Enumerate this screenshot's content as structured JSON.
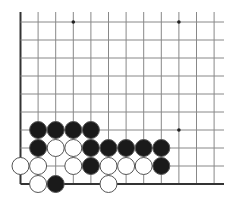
{
  "board": {
    "grid": {
      "left_x": 20.5,
      "top_y": 22,
      "col_spacing": 17.6,
      "row_spacing": 18,
      "cols": 12,
      "rows": 10,
      "right_x": 224,
      "top_extends_to": 12
    },
    "colors": {
      "line": "#888888",
      "edge": "#333333",
      "black_stone": "#1a1a1a",
      "white_stone": "#ffffff",
      "stone_outline": "#555555"
    },
    "star_points": [
      {
        "col": 3,
        "row": 0
      },
      {
        "col": 9,
        "row": 0
      },
      {
        "col": 9,
        "row": 6
      }
    ],
    "stones": [
      {
        "color": "black",
        "col": 1,
        "row": 6
      },
      {
        "color": "black",
        "col": 2,
        "row": 6
      },
      {
        "color": "black",
        "col": 3,
        "row": 6
      },
      {
        "color": "black",
        "col": 4,
        "row": 6
      },
      {
        "color": "black",
        "col": 1,
        "row": 7
      },
      {
        "color": "white",
        "col": 2,
        "row": 7
      },
      {
        "color": "white",
        "col": 3,
        "row": 7
      },
      {
        "color": "black",
        "col": 4,
        "row": 7
      },
      {
        "color": "black",
        "col": 5,
        "row": 7
      },
      {
        "color": "black",
        "col": 6,
        "row": 7
      },
      {
        "color": "black",
        "col": 7,
        "row": 7
      },
      {
        "color": "black",
        "col": 8,
        "row": 7
      },
      {
        "color": "white",
        "col": 0,
        "row": 8
      },
      {
        "color": "white",
        "col": 1,
        "row": 8
      },
      {
        "color": "white",
        "col": 3,
        "row": 8
      },
      {
        "color": "black",
        "col": 4,
        "row": 8
      },
      {
        "color": "white",
        "col": 5,
        "row": 8
      },
      {
        "color": "white",
        "col": 6,
        "row": 8
      },
      {
        "color": "white",
        "col": 7,
        "row": 8
      },
      {
        "color": "black",
        "col": 8,
        "row": 8
      },
      {
        "color": "white",
        "col": 1,
        "row": 9
      },
      {
        "color": "black",
        "col": 2,
        "row": 9
      },
      {
        "color": "white",
        "col": 5,
        "row": 9
      }
    ]
  }
}
